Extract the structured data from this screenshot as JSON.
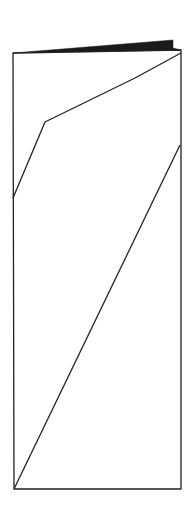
{
  "diagram": {
    "colors": {
      "background": "#ffffff",
      "stroke": "#222222",
      "flap_fill": "#1a1a1a"
    },
    "stroke_width": 1.3,
    "outline": {
      "points": "13,53 181,50 181,489 14,489"
    },
    "flap": {
      "points": "13,53 173,40 173,48 181,50"
    },
    "fold_upper": {
      "points": "181,53 135,78 45,122 13,198"
    },
    "fold_lower": {
      "points": "180,145 14,489"
    }
  }
}
